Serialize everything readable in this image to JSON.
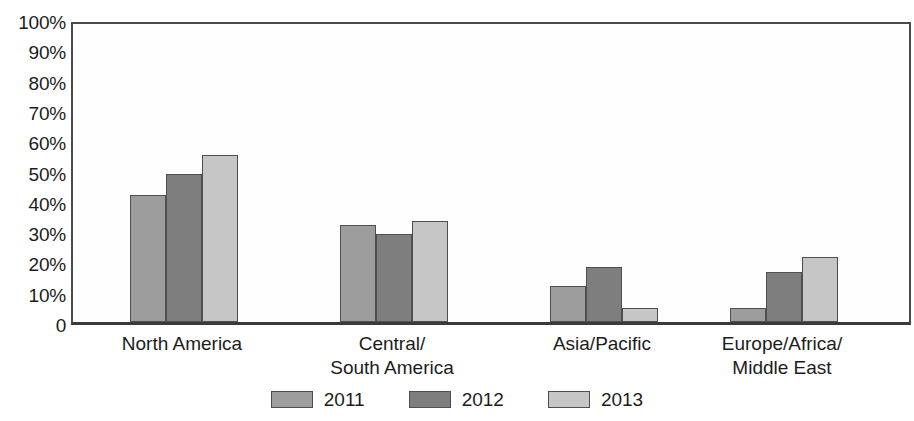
{
  "chart_data": {
    "type": "bar",
    "title": "",
    "subtitle": "",
    "xlabel": "",
    "ylabel": "",
    "ylim": [
      0,
      100
    ],
    "grid": false,
    "legend_position": "bottom",
    "categories": [
      "North America",
      "Central/\nSouth America",
      "Asia/Pacific",
      "Europe/Africa/\nMiddle East"
    ],
    "ytick_labels": [
      "100%",
      "90%",
      "80%",
      "70%",
      "60%",
      "50%",
      "40%",
      "30%",
      "20%",
      "10%",
      "0"
    ],
    "ytick_values": [
      100,
      90,
      80,
      70,
      60,
      50,
      40,
      30,
      20,
      10,
      0
    ],
    "series": [
      {
        "name": "2011",
        "color": "#9d9d9d",
        "values": [
          42,
          32,
          12,
          4.5
        ]
      },
      {
        "name": "2012",
        "color": "#7e7e7e",
        "values": [
          49,
          29,
          18,
          16.5
        ]
      },
      {
        "name": "2013",
        "color": "#c6c6c6",
        "values": [
          55,
          33.5,
          4.5,
          21.5
        ]
      }
    ]
  },
  "legend": {
    "items": [
      {
        "label": "2011",
        "color": "#9d9d9d"
      },
      {
        "label": "2012",
        "color": "#7e7e7e"
      },
      {
        "label": "2013",
        "color": "#c6c6c6"
      }
    ]
  },
  "axis": {
    "line_color": "#4a4a4a",
    "bar_border_color": "#4f4f4f"
  }
}
